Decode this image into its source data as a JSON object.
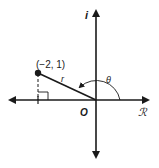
{
  "diagram": {
    "type": "complex-plane-polar",
    "axes": {
      "real_label": "ℛ",
      "imaginary_label": "i",
      "origin_label": "O"
    },
    "point": {
      "label": "(−2, 1)",
      "x": -2,
      "y": 1
    },
    "radius_label": "r",
    "angle_label": "θ",
    "colors": {
      "ink": "#1a1a1a",
      "background": "#ffffff"
    }
  }
}
